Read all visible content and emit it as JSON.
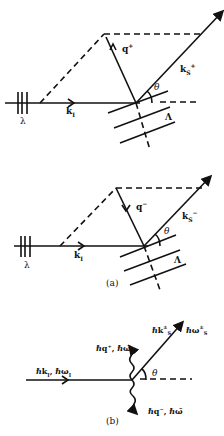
{
  "figure": {
    "panel_a_top": {
      "labels": {
        "incident": "k",
        "incident_sub": "I",
        "grating_spacing": "λ",
        "acoustic_wave": "q",
        "acoustic_sup": "+",
        "scattered": "k",
        "scattered_sub": "S",
        "scattered_sup": "+",
        "angle": "θ",
        "acoustic_wavelength": "Λ"
      }
    },
    "panel_a_bottom": {
      "labels": {
        "incident": "k",
        "incident_sub": "I",
        "grating_spacing": "λ",
        "acoustic_wave": "q",
        "acoustic_sup": "−",
        "scattered": "k",
        "scattered_sub": "S",
        "scattered_sup": "−",
        "angle": "θ",
        "acoustic_wavelength": "Λ"
      },
      "caption": "(a)"
    },
    "panel_b": {
      "labels": {
        "incident": "ℏk",
        "incident_sub": "I",
        "incident_energy": ", ℏω",
        "incident_energy_sub": "I",
        "scattered": "ℏk",
        "scattered_sup": "±",
        "scattered_sub": "S",
        "scattered_energy": "ℏω",
        "scattered_energy_sup": "±",
        "scattered_energy_sub": "S",
        "phonon_plus": "ℏq⁺, ℏω̄",
        "phonon_minus": "ℏq⁻, ℏω̄",
        "angle": "θ"
      },
      "caption": "(b)"
    }
  }
}
